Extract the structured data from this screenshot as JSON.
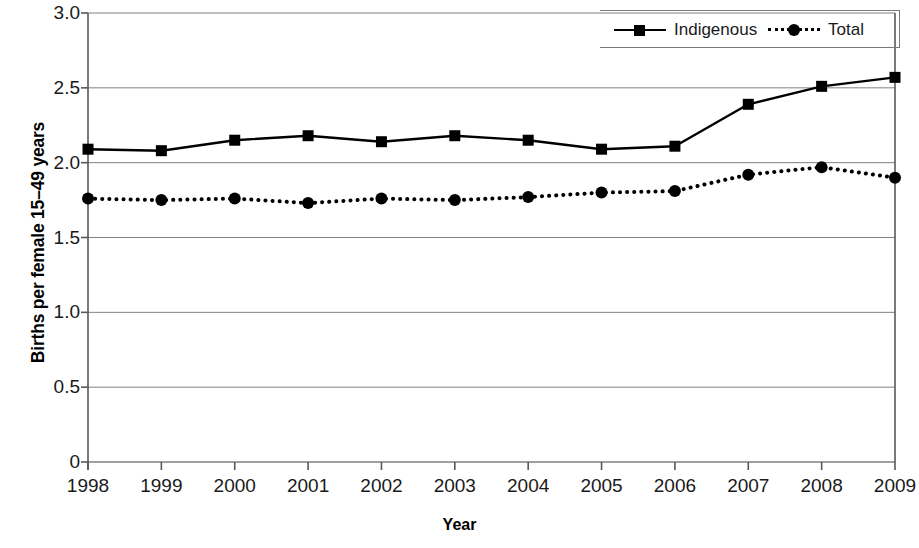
{
  "chart_data": {
    "type": "line",
    "title": "",
    "xlabel": "Year",
    "ylabel": "Births per female 15–49 years",
    "categories": [
      "1998",
      "1999",
      "2000",
      "2001",
      "2002",
      "2003",
      "2004",
      "2005",
      "2006",
      "2007",
      "2008",
      "2009"
    ],
    "x": [
      1998,
      1999,
      2000,
      2001,
      2002,
      2003,
      2004,
      2005,
      2006,
      2007,
      2008,
      2009
    ],
    "series": [
      {
        "name": "Indigenous",
        "values": [
          2.09,
          2.08,
          2.15,
          2.18,
          2.14,
          2.18,
          2.15,
          2.09,
          2.11,
          2.39,
          2.51,
          2.57
        ],
        "line_style": "solid",
        "marker": "square",
        "color": "#000000"
      },
      {
        "name": "Total",
        "values": [
          1.76,
          1.75,
          1.76,
          1.73,
          1.76,
          1.75,
          1.77,
          1.8,
          1.81,
          1.92,
          1.97,
          1.9
        ],
        "line_style": "dotted",
        "marker": "circle",
        "color": "#000000"
      }
    ],
    "ylim": [
      0,
      3.0
    ],
    "yticks": [
      0,
      0.5,
      1.0,
      1.5,
      2.0,
      2.5,
      3.0
    ],
    "ytick_labels": [
      "0",
      "0.5",
      "1.0",
      "1.5",
      "2.0",
      "2.5",
      "3.0"
    ],
    "xtick_labels": [
      "1998",
      "1999",
      "2000",
      "2001",
      "2002",
      "2003",
      "2004",
      "2005",
      "2006",
      "2007",
      "2008",
      "2009"
    ],
    "grid": "horizontal",
    "legend_position": "top-right",
    "legend_entries": [
      "Indigenous",
      "Total"
    ]
  },
  "axes": {
    "y_title": "Births per female 15–49 years",
    "x_title": "Year"
  },
  "legend": {
    "indigenous_label": "Indigenous",
    "total_label": "Total"
  },
  "colors": {
    "line": "#000000",
    "grid": "#808080",
    "axis": "#595959",
    "text": "#1a1a1a"
  }
}
